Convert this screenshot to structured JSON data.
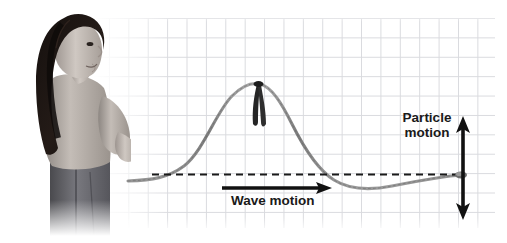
{
  "figure": {
    "width": 507,
    "height": 243,
    "background_color": "#ffffff",
    "grid_color": "#d9dade"
  },
  "labels": {
    "particle_motion_line1": "Particle",
    "particle_motion_line2": "motion",
    "wave_motion": "Wave motion"
  },
  "annotations": {
    "wave_motion_arrow": {
      "name": "horizontal-arrow-right",
      "direction": "right",
      "x1": 222,
      "y1": 188,
      "x2": 332,
      "y2": 188,
      "color": "#111111"
    },
    "particle_motion_arrow": {
      "name": "vertical-double-arrow",
      "direction": "up-down",
      "x": 463,
      "y1": 117,
      "y2": 219,
      "color": "#111111"
    },
    "equilibrium_line": {
      "name": "dashed-equilibrium-line",
      "x1": 152,
      "x2": 462,
      "y": 174,
      "style": "dashed",
      "color": "#1a1a1a"
    }
  },
  "elements": {
    "rope_color": "#8c8c8c",
    "ribbon_color": "#2b2b2b",
    "ribbon_crest_x": 258,
    "ribbon_crest_y": 84,
    "rope_end_x": 461,
    "rope_end_y": 175,
    "person_description": "woman standing in profile holding the end of a rope"
  }
}
